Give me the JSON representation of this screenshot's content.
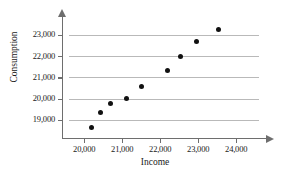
{
  "chart_data": {
    "type": "scatter",
    "title": "",
    "xlabel": "Income",
    "ylabel": "Consumption",
    "xlim": [
      19600,
      24600
    ],
    "ylim": [
      18200,
      23600
    ],
    "grid": true,
    "legend": null,
    "xticks": [
      20000,
      21000,
      22000,
      23000,
      24000
    ],
    "xtick_labels": [
      "20,000",
      "21,000",
      "22,000",
      "23,000",
      "24,000"
    ],
    "yticks": [
      19000,
      20000,
      21000,
      22000,
      23000
    ],
    "ytick_labels": [
      "19,000",
      "20,000",
      "21,000",
      "22,000",
      "23,000"
    ],
    "x": [
      20190,
      20440,
      20700,
      21120,
      21510,
      22190,
      22530,
      22950,
      23530
    ],
    "y": [
      18650,
      19350,
      19780,
      20020,
      20560,
      21330,
      22000,
      22700,
      23240
    ],
    "points": [
      {
        "x": 20190,
        "y": 18650
      },
      {
        "x": 20440,
        "y": 19350
      },
      {
        "x": 20700,
        "y": 19780
      },
      {
        "x": 21120,
        "y": 20020
      },
      {
        "x": 21510,
        "y": 20560
      },
      {
        "x": 22190,
        "y": 21330
      },
      {
        "x": 22530,
        "y": 22000
      },
      {
        "x": 22950,
        "y": 22700
      },
      {
        "x": 23530,
        "y": 23240
      }
    ],
    "marker": "filled-circle",
    "marker_color": "#111111",
    "gridline_color": "#b9b9b9",
    "axis_color": "#6e6e6e"
  }
}
